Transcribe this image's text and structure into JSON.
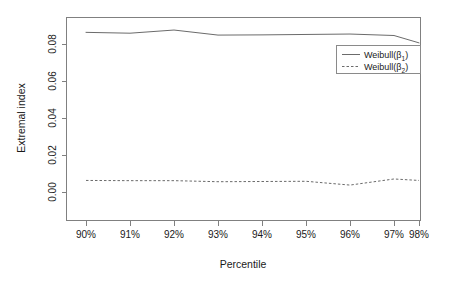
{
  "chart_data": {
    "type": "line",
    "title": "",
    "xlabel": "Percentile",
    "ylabel": "Extremal index",
    "categories": [
      "90%",
      "91%",
      "92%",
      "93%",
      "94%",
      "95%",
      "96%",
      "97%",
      "98%"
    ],
    "xtick_labels": [
      "90%",
      "91%",
      "92%",
      "93%",
      "94%",
      "95%",
      "96%",
      "97%",
      "98%"
    ],
    "ytick_labels": [
      "0.00",
      "0.02",
      "0.04",
      "0.06",
      "0.08"
    ],
    "ytick_values": [
      0.0,
      0.02,
      0.04,
      0.06,
      0.08
    ],
    "ylim": [
      -0.003,
      0.0935
    ],
    "grid": false,
    "legend_position": "top-right",
    "series": [
      {
        "name": "Weibull(β₁)",
        "name_base": "Weibull(β",
        "name_sub": "1",
        "name_close": ")",
        "style": "solid",
        "color": "#6b6b6b",
        "values": [
          0.0862,
          0.0858,
          0.0873,
          0.0849,
          0.085,
          0.0852,
          0.0854,
          0.0847,
          0.0812
        ]
      },
      {
        "name": "Weibull(β₂)",
        "name_base": "Weibull(β",
        "name_sub": "2",
        "name_close": ")",
        "style": "dashed",
        "color": "#6b6b6b",
        "values": [
          0.0158,
          0.0157,
          0.0157,
          0.0152,
          0.0153,
          0.0154,
          0.0136,
          0.0165,
          0.0158
        ]
      }
    ]
  },
  "legend": {
    "entries": [
      {
        "label_base": "Weibull(β",
        "label_sub": "1",
        "label_close": ")",
        "style": "solid"
      },
      {
        "label_base": "Weibull(β",
        "label_sub": "2",
        "label_close": ")",
        "style": "dashed"
      }
    ]
  }
}
